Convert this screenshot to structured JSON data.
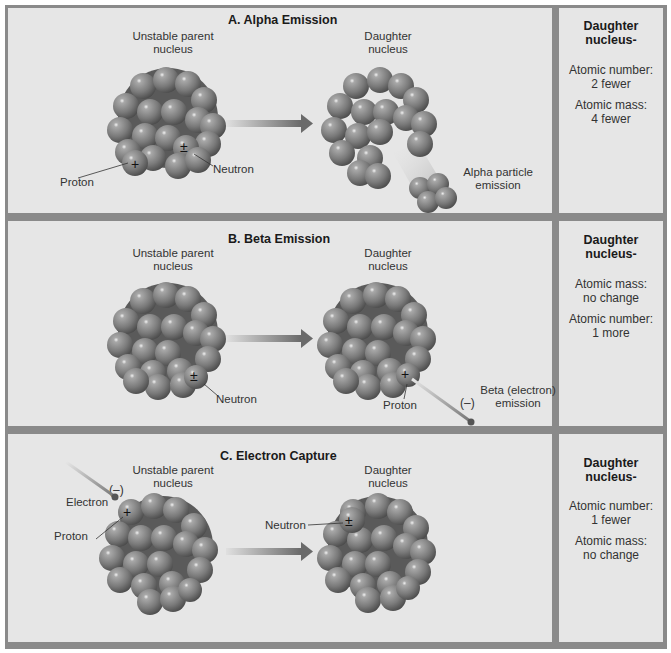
{
  "sections": [
    {
      "title": "A. Alpha Emission",
      "parent_label_1": "Unstable parent",
      "parent_label_2": "nucleus",
      "daughter_label_1": "Daughter",
      "daughter_label_2": "nucleus",
      "annotations": {
        "proton": "Proton",
        "neutron": "Neutron",
        "emission_1": "Alpha particle",
        "emission_2": "emission"
      },
      "side": {
        "heading_1": "Daughter",
        "heading_2": "nucleus-",
        "fact1_label": "Atomic number:",
        "fact1_value": "2 fewer",
        "fact2_label": "Atomic mass:",
        "fact2_value": "4 fewer"
      }
    },
    {
      "title": "B. Beta Emission",
      "parent_label_1": "Unstable parent",
      "parent_label_2": "nucleus",
      "daughter_label_1": "Daughter",
      "daughter_label_2": "nucleus",
      "annotations": {
        "neutron": "Neutron",
        "proton": "Proton",
        "emission_1": "Beta (electron)",
        "emission_2": "emission",
        "electron_charge": "(–)"
      },
      "side": {
        "heading_1": "Daughter",
        "heading_2": "nucleus-",
        "fact1_label": "Atomic mass:",
        "fact1_value": "no change",
        "fact2_label": "Atomic number:",
        "fact2_value": "1 more"
      }
    },
    {
      "title": "C. Electron Capture",
      "parent_label_1": "Unstable parent",
      "parent_label_2": "nucleus",
      "daughter_label_1": "Daughter",
      "daughter_label_2": "nucleus",
      "annotations": {
        "electron": "Electron",
        "electron_charge": "(–)",
        "proton": "Proton",
        "neutron": "Neutron"
      },
      "side": {
        "heading_1": "Daughter",
        "heading_2": "nucleus-",
        "fact1_label": "Atomic number:",
        "fact1_value": "1 fewer",
        "fact2_label": "Atomic mass:",
        "fact2_value": "no change"
      }
    }
  ],
  "symbols": {
    "plus": "+",
    "neutron": "±"
  },
  "colors": {
    "panel_bg": "#e6e6e6",
    "border": "#8a8a8a",
    "sphere": "#7e7e7e",
    "arrow": "#707070"
  }
}
